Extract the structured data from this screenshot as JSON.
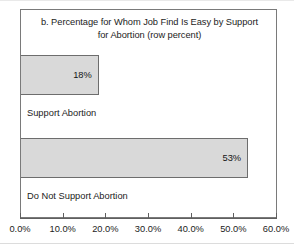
{
  "chart_data": {
    "type": "bar",
    "orientation": "horizontal",
    "title": "b. Percentage for Whom Job Find Is Easy by Support for Abortion (row percent)",
    "title_line1": "b. Percentage for Whom Job Find Is Easy by Support",
    "title_line2": "for Abortion (row percent)",
    "xlabel": "",
    "ylabel": "",
    "categories": [
      "Support Abortion",
      "Do Not Support Abortion"
    ],
    "values": [
      18,
      53
    ],
    "value_labels": [
      "18%",
      "53%"
    ],
    "xlim": [
      0,
      60
    ],
    "xticks": [
      0,
      10,
      20,
      30,
      40,
      50,
      60
    ],
    "xtick_labels": [
      "0.0%",
      "10.0%",
      "20.0%",
      "30.0%",
      "40.0%",
      "50.0%",
      "60.0%"
    ],
    "grid": false,
    "legend": false,
    "bar_fill_color": "#d9d9d9",
    "bar_border_color": "#6d6d6d",
    "frame_color": "#7a7a7a"
  }
}
